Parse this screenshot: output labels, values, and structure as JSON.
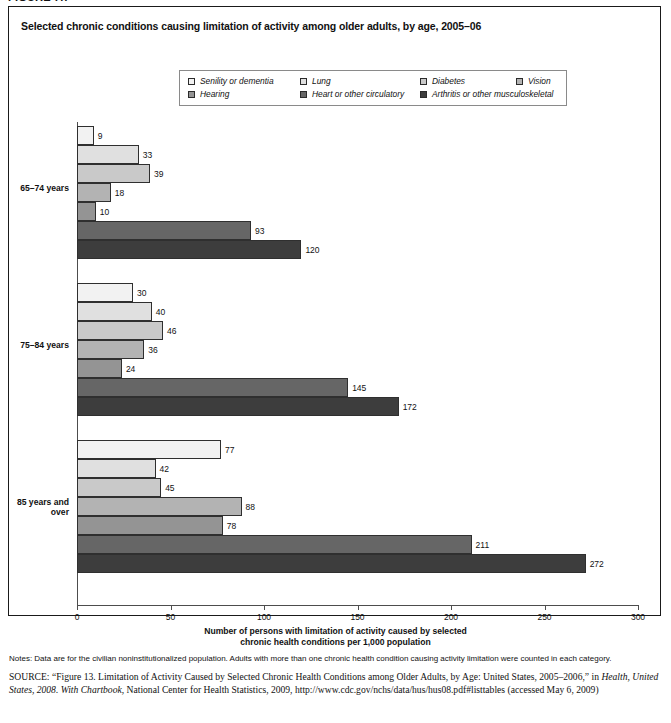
{
  "figure_label": "FIGURE 7.7",
  "panel": {
    "title": "Selected chronic conditions causing limitation of activity among older adults, by age, 2005–06"
  },
  "legend": {
    "rows": [
      [
        {
          "label": "Senility or dementia",
          "color": "#f2f2f2",
          "name": "senility-or-dementia"
        },
        {
          "label": "Lung",
          "color": "#e0e0e0",
          "name": "lung"
        },
        {
          "label": "Diabetes",
          "color": "#c9c9c9",
          "name": "diabetes"
        },
        {
          "label": "Vision",
          "color": "#b3b3b3",
          "name": "vision"
        }
      ],
      [
        {
          "label": "Hearing",
          "color": "#949494",
          "name": "hearing"
        },
        {
          "label": "Heart or other circulatory",
          "color": "#666666",
          "name": "heart-or-other-circulatory"
        },
        {
          "label": "Arthritis or other musculoskeletal",
          "color": "#3d3d3d",
          "name": "arthritis-or-other-musculoskeletal"
        }
      ]
    ]
  },
  "chart_data": {
    "type": "bar",
    "orientation": "horizontal",
    "title": "Selected chronic conditions causing limitation of activity among older adults, by age, 2005–06",
    "xlabel": "Number of persons with limitation of activity caused by selected chronic health conditions per 1,000 population",
    "ylabel": "",
    "xlim": [
      0,
      300
    ],
    "xticks": [
      0,
      50,
      100,
      150,
      200,
      250,
      300
    ],
    "grid": false,
    "legend_position": "top-center",
    "categories": [
      "65–74 years",
      "75–84 years",
      "85 years and over"
    ],
    "series": [
      {
        "name": "Senility or dementia",
        "color": "#f2f2f2",
        "values": [
          9,
          30,
          77
        ]
      },
      {
        "name": "Lung",
        "color": "#e0e0e0",
        "values": [
          33,
          40,
          42
        ]
      },
      {
        "name": "Diabetes",
        "color": "#c9c9c9",
        "values": [
          39,
          46,
          45
        ]
      },
      {
        "name": "Vision",
        "color": "#b3b3b3",
        "values": [
          18,
          36,
          88
        ]
      },
      {
        "name": "Hearing",
        "color": "#949494",
        "values": [
          10,
          24,
          78
        ]
      },
      {
        "name": "Heart or other circulatory",
        "color": "#666666",
        "values": [
          93,
          145,
          211
        ]
      },
      {
        "name": "Arthritis or other musculoskeletal",
        "color": "#3d3d3d",
        "values": [
          120,
          172,
          272
        ]
      }
    ]
  },
  "axis": {
    "title_line1": "Number of persons with limitation of activity caused by selected",
    "title_line2": "chronic health conditions per 1,000 population",
    "tick_labels": [
      "0",
      "50",
      "100",
      "150",
      "200",
      "250",
      "300"
    ]
  },
  "group_labels": [
    "65–74 years",
    "75–84 years",
    "85 years and\nover"
  ],
  "notes": "Notes: Data are for the civilian noninstitutionalized population. Adults with more than one chronic health condition causing activity limitation were counted in each category.",
  "source": {
    "prefix": "SOURCE",
    "part1": ": “Figure 13. Limitation of Activity Caused by Selected Chronic Health Conditions among Older Adults, by Age: United States, 2005–2006,” in ",
    "italic1": "Health, United States, 2008. With Chartbook",
    "part2": ", National Center for Health Statistics, 2009, http://www.cdc.gov/nchs/data/hus/hus08.pdf#listtables (accessed May 6, 2009)"
  }
}
